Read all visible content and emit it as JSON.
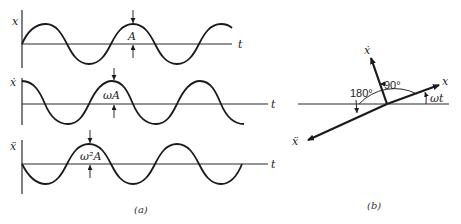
{
  "figure": {
    "panel_a": {
      "caption": "(a)",
      "plots": [
        {
          "y_label": "x",
          "t_label": "t",
          "amplitude_label": "A",
          "phase": "sin"
        },
        {
          "y_label": "ẋ",
          "t_label": "t",
          "amplitude_label": "ωA",
          "phase": "cos"
        },
        {
          "y_label": "ẍ",
          "t_label": "t",
          "amplitude_label": "ω²A",
          "phase": "-sin"
        }
      ]
    },
    "panel_b": {
      "caption": "(b)",
      "vectors": [
        {
          "label": "x",
          "description": "displacement phasor at angle ωt"
        },
        {
          "label": "ẋ",
          "description": "velocity phasor, leads x by 90°"
        },
        {
          "label": "ẍ",
          "description": "acceleration phasor, leads x by 180°"
        }
      ],
      "angles": {
        "right_angle": "90°",
        "straight_angle": "180°",
        "phase_angle": "ωt"
      }
    }
  }
}
